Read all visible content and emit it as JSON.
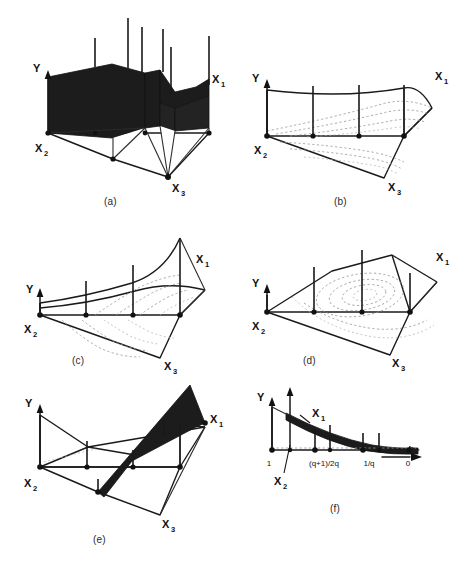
{
  "figure": {
    "background_color": "#ffffff",
    "ink_color": "#111111",
    "contour_color": "#9a9a9a",
    "width": 464,
    "height": 569
  },
  "panels": [
    {
      "id": "a",
      "caption": "(a)",
      "axis_y_label": "Y",
      "axis_x1_label": "X",
      "axis_x1_sub": "1",
      "axis_x2_label": "X",
      "axis_x2_sub": "2",
      "axis_x3_label": "X",
      "axis_x3_sub": "3",
      "surface_style": "solid-black-blocks",
      "stick_count": 6
    },
    {
      "id": "b",
      "caption": "(b)",
      "axis_y_label": "Y",
      "axis_x1_label": "X",
      "axis_x1_sub": "1",
      "axis_x2_label": "X",
      "axis_x2_sub": "2",
      "axis_x3_label": "X",
      "axis_x3_sub": "3",
      "surface_style": "wireframe-with-contours",
      "stick_count": 4
    },
    {
      "id": "c",
      "caption": "(c)",
      "axis_y_label": "Y",
      "axis_x1_label": "X",
      "axis_x1_sub": "1",
      "axis_x2_label": "X",
      "axis_x2_sub": "2",
      "axis_x3_label": "X",
      "axis_x3_sub": "3",
      "surface_style": "wireframe-with-contours",
      "stick_count": 4
    },
    {
      "id": "d",
      "caption": "(d)",
      "axis_y_label": "Y",
      "axis_x1_label": "X",
      "axis_x1_sub": "1",
      "axis_x2_label": "X",
      "axis_x2_sub": "2",
      "axis_x3_label": "X",
      "axis_x3_sub": "3",
      "surface_style": "wireframe-with-closed-contours",
      "stick_count": 4
    },
    {
      "id": "e",
      "caption": "(e)",
      "axis_y_label": "Y",
      "axis_x1_label": "X",
      "axis_x1_sub": "1",
      "axis_x2_label": "X",
      "axis_x2_sub": "2",
      "axis_x3_label": "X",
      "axis_x3_sub": "3",
      "surface_style": "wireframe-with-black-ribbon",
      "stick_count": 4
    },
    {
      "id": "f",
      "caption": "(f)",
      "axis_y_label": "Y",
      "axis_x1_label": "X",
      "axis_x1_sub": "1",
      "axis_x2_label": "X",
      "axis_x2_sub": "2",
      "surface_style": "2d-black-band",
      "stick_count": 4,
      "tick_labels": [
        "1",
        "(q+1)/2q",
        "1/q",
        "0"
      ]
    }
  ]
}
